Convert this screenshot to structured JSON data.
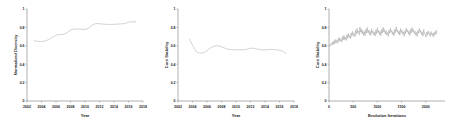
{
  "figure": {
    "background": "#ffffff",
    "line_color": "#b9b9b9",
    "axis_color": "#8c8c8c",
    "text_color": "#1a1a1a",
    "panel_count": 3
  },
  "chart_data": [
    {
      "type": "line",
      "title": "",
      "xlabel": "Year",
      "ylabel": "Normalized Diversity",
      "xlim": [
        2002,
        2018
      ],
      "ylim": [
        0,
        1
      ],
      "xticks": [
        2002,
        2004,
        2006,
        2008,
        2010,
        2012,
        2014,
        2016,
        2018
      ],
      "xticklabels": [
        "2002",
        "2004",
        "2006",
        "2008",
        "2010",
        "2012",
        "2014",
        "2016",
        "2018"
      ],
      "yticks": [
        0,
        0.2,
        0.4,
        0.6,
        0.8,
        1
      ],
      "yticklabels": [
        "0",
        "0.2",
        "0.4",
        "0.6",
        "0.8",
        "1"
      ],
      "grid": false,
      "legend": false,
      "x": [
        2003.0,
        2003.5,
        2004.0,
        2004.5,
        2005.0,
        2005.5,
        2006.0,
        2006.5,
        2007.0,
        2007.5,
        2008.0,
        2008.5,
        2009.0,
        2009.5,
        2010.0,
        2010.5,
        2011.0,
        2011.5,
        2012.0,
        2012.5,
        2013.0,
        2013.5,
        2014.0,
        2014.5,
        2015.0,
        2015.5,
        2016.0,
        2016.5,
        2017.0
      ],
      "values": [
        0.655,
        0.648,
        0.646,
        0.652,
        0.668,
        0.692,
        0.716,
        0.722,
        0.724,
        0.742,
        0.771,
        0.782,
        0.783,
        0.779,
        0.777,
        0.793,
        0.826,
        0.842,
        0.84,
        0.836,
        0.833,
        0.832,
        0.833,
        0.836,
        0.838,
        0.842,
        0.856,
        0.862,
        0.861
      ]
    },
    {
      "type": "line",
      "title": "",
      "xlabel": "Year",
      "ylabel": "Core Stability",
      "xlim": [
        2002,
        2018
      ],
      "ylim": [
        0,
        1
      ],
      "xticks": [
        2002,
        2004,
        2006,
        2008,
        2010,
        2012,
        2014,
        2016,
        2018
      ],
      "xticklabels": [
        "2002",
        "2004",
        "2006",
        "2008",
        "2010",
        "2012",
        "2014",
        "2016",
        "2018"
      ],
      "yticks": [
        0,
        0.2,
        0.4,
        0.6,
        0.8,
        1
      ],
      "yticklabels": [
        "0",
        "0.2",
        "0.4",
        "0.6",
        "0.8",
        "1"
      ],
      "grid": false,
      "legend": false,
      "x": [
        2003.6,
        2004.0,
        2004.5,
        2005.0,
        2005.5,
        2006.0,
        2006.5,
        2007.0,
        2007.5,
        2008.0,
        2008.5,
        2009.0,
        2009.5,
        2010.0,
        2010.5,
        2011.0,
        2011.5,
        2012.0,
        2012.5,
        2013.0,
        2013.5,
        2014.0,
        2014.5,
        2015.0,
        2015.5,
        2016.0,
        2016.5,
        2016.9
      ],
      "values": [
        0.672,
        0.604,
        0.538,
        0.519,
        0.524,
        0.548,
        0.578,
        0.598,
        0.601,
        0.589,
        0.573,
        0.562,
        0.557,
        0.556,
        0.558,
        0.556,
        0.562,
        0.574,
        0.572,
        0.563,
        0.556,
        0.556,
        0.561,
        0.56,
        0.556,
        0.553,
        0.54,
        0.516
      ]
    },
    {
      "type": "line",
      "title": "",
      "xlabel": "Evolution Iterations",
      "ylabel": "Core Stability",
      "xlim": [
        0,
        2400
      ],
      "ylim": [
        0,
        1
      ],
      "xticks": [
        0,
        500,
        1000,
        1500,
        2000
      ],
      "xticklabels": [
        "0",
        "500",
        "1000",
        "1500",
        "2000"
      ],
      "yticks": [
        0,
        0.2,
        0.4,
        0.6,
        0.8,
        1
      ],
      "yticklabels": [
        "0",
        "0.2",
        "0.4",
        "0.6",
        "0.8",
        "1"
      ],
      "grid": false,
      "legend": false,
      "x": [
        10,
        25,
        40,
        55,
        70,
        85,
        100,
        115,
        130,
        145,
        160,
        175,
        190,
        205,
        220,
        235,
        250,
        265,
        280,
        295,
        310,
        325,
        340,
        355,
        370,
        385,
        400,
        415,
        430,
        445,
        460,
        475,
        490,
        505,
        520,
        535,
        550,
        565,
        580,
        595,
        610,
        625,
        640,
        655,
        670,
        685,
        700,
        715,
        730,
        745,
        760,
        775,
        790,
        805,
        820,
        835,
        850,
        865,
        880,
        895,
        910,
        925,
        940,
        955,
        970,
        985,
        1000,
        1015,
        1030,
        1045,
        1060,
        1075,
        1090,
        1105,
        1120,
        1135,
        1150,
        1165,
        1180,
        1195,
        1210,
        1225,
        1240,
        1255,
        1270,
        1285,
        1300,
        1315,
        1330,
        1345,
        1360,
        1375,
        1390,
        1405,
        1420,
        1435,
        1450,
        1465,
        1480,
        1495,
        1510,
        1525,
        1540,
        1555,
        1570,
        1585,
        1600,
        1615,
        1630,
        1645,
        1660,
        1675,
        1690,
        1705,
        1720,
        1735,
        1750,
        1765,
        1780,
        1795,
        1810,
        1825,
        1840,
        1855,
        1870,
        1885,
        1900,
        1915,
        1930,
        1945,
        1960,
        1975,
        1990,
        2005,
        2020,
        2035,
        2050,
        2065,
        2080,
        2095,
        2110,
        2125,
        2140,
        2155,
        2170,
        2185,
        2200,
        2215,
        2230,
        2245,
        2260,
        2275,
        2290
      ],
      "values": [
        0.601,
        0.596,
        0.624,
        0.607,
        0.642,
        0.612,
        0.655,
        0.621,
        0.668,
        0.634,
        0.659,
        0.627,
        0.681,
        0.645,
        0.69,
        0.651,
        0.673,
        0.639,
        0.701,
        0.662,
        0.713,
        0.668,
        0.695,
        0.658,
        0.722,
        0.681,
        0.735,
        0.692,
        0.714,
        0.676,
        0.741,
        0.703,
        0.756,
        0.712,
        0.733,
        0.697,
        0.768,
        0.724,
        0.79,
        0.742,
        0.761,
        0.719,
        0.806,
        0.748,
        0.781,
        0.731,
        0.766,
        0.715,
        0.752,
        0.708,
        0.778,
        0.736,
        0.799,
        0.745,
        0.771,
        0.722,
        0.758,
        0.713,
        0.786,
        0.739,
        0.762,
        0.718,
        0.748,
        0.706,
        0.773,
        0.731,
        0.795,
        0.744,
        0.767,
        0.721,
        0.755,
        0.71,
        0.781,
        0.738,
        0.802,
        0.751,
        0.776,
        0.729,
        0.763,
        0.716,
        0.744,
        0.702,
        0.77,
        0.734,
        0.791,
        0.747,
        0.765,
        0.723,
        0.752,
        0.709,
        0.779,
        0.741,
        0.806,
        0.756,
        0.774,
        0.728,
        0.76,
        0.714,
        0.787,
        0.743,
        0.769,
        0.725,
        0.75,
        0.705,
        0.766,
        0.732,
        0.793,
        0.749,
        0.771,
        0.726,
        0.757,
        0.712,
        0.783,
        0.74,
        0.798,
        0.752,
        0.773,
        0.73,
        0.759,
        0.715,
        0.745,
        0.701,
        0.768,
        0.735,
        0.789,
        0.746,
        0.764,
        0.72,
        0.751,
        0.707,
        0.777,
        0.737,
        0.722,
        0.694,
        0.748,
        0.716,
        0.763,
        0.728,
        0.741,
        0.703,
        0.756,
        0.719,
        0.734,
        0.698,
        0.745,
        0.712,
        0.758,
        0.726,
        0.77
      ]
    }
  ]
}
